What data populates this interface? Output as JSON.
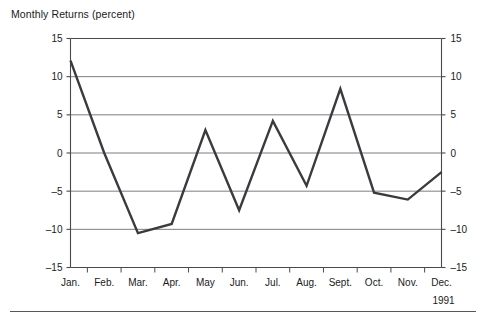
{
  "figure": {
    "title": "Monthly Returns (percent)",
    "year_label": "1991",
    "background_color": "#ffffff",
    "line_color": "#3b3b3f",
    "grid_color": "#6e6e72",
    "axis_color": "#4a4a4e",
    "text_color": "#1a1a1a",
    "rule_color": "#58585c"
  },
  "chart_data": {
    "type": "line",
    "title": "Monthly Returns (percent)",
    "xlabel": "1991",
    "ylabel": "",
    "ylim": [
      -15,
      15
    ],
    "yticks": [
      15,
      10,
      5,
      0,
      -5,
      -10,
      -15
    ],
    "ytick_labels": [
      "15",
      "10",
      "5",
      "0",
      "-5",
      "-10",
      "-15"
    ],
    "right_axis_labels": [
      "15",
      "10",
      "5",
      "0",
      "-5",
      "-10",
      "-15"
    ],
    "gridlines_at": [
      10,
      5,
      0,
      -5,
      -10
    ],
    "grid": true,
    "legend": "none",
    "categories": [
      "Jan.",
      "Feb.",
      "Mar.",
      "Apr.",
      "May",
      "Jun.",
      "Jul.",
      "Aug.",
      "Sept.",
      "Oct.",
      "Nov.",
      "Dec."
    ],
    "values": [
      12.1,
      0.0,
      -10.5,
      -9.3,
      3.0,
      -7.5,
      4.2,
      -4.3,
      8.4,
      -5.2,
      -6.1,
      -2.5
    ],
    "series": [
      {
        "name": "Monthly Returns",
        "values": [
          12.1,
          0.0,
          -10.5,
          -9.3,
          3.0,
          -7.5,
          4.2,
          -4.3,
          8.4,
          -5.2,
          -6.1,
          -2.5
        ]
      }
    ]
  }
}
